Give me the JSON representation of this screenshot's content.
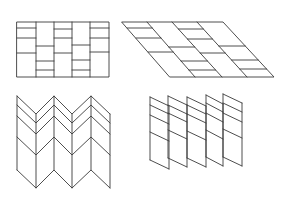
{
  "canvas": {
    "width": 285,
    "height": 198,
    "background": "#ffffff",
    "stroke_color": "#3a3a3a",
    "stroke_width": 0.9
  },
  "figures": [
    {
      "id": "brick-rectangle",
      "description": "Flat rectangle divided into 5 vertical strips with staggered horizontal crease lines",
      "outline": [
        [
          17,
          22
        ],
        [
          109,
          22
        ],
        [
          109,
          77
        ],
        [
          17,
          77
        ]
      ],
      "verticals": [
        36,
        54,
        72,
        90
      ],
      "strips": [
        {
          "x1": 17,
          "x2": 36,
          "ys": [
            28,
            38,
            53
          ]
        },
        {
          "x1": 36,
          "x2": 54,
          "ys": [
            46,
            61,
            70
          ]
        },
        {
          "x1": 54,
          "x2": 72,
          "ys": [
            29,
            38,
            53
          ]
        },
        {
          "x1": 72,
          "x2": 90,
          "ys": [
            45,
            60,
            70
          ]
        },
        {
          "x1": 90,
          "x2": 109,
          "ys": [
            28,
            38,
            52
          ]
        }
      ]
    },
    {
      "id": "sheared-parallelogram",
      "description": "Same pattern sheared into a parallelogram with 4 slanted strips",
      "top_y": 22,
      "bottom_y": 77,
      "slant_tops": [
        122,
        147,
        172,
        197,
        223
      ],
      "slant_bottoms": [
        170,
        195,
        222,
        247,
        274
      ],
      "strips": [
        {
          "ys": [
            28,
            38,
            52
          ]
        },
        {
          "ys": [
            47,
            61,
            70
          ]
        },
        {
          "ys": [
            29,
            39,
            53
          ]
        },
        {
          "ys": [
            46,
            60,
            69
          ]
        }
      ]
    },
    {
      "id": "zigzag-fold",
      "description": "Folded zigzag (chevron) surface with vertical fold lines",
      "xs": [
        17,
        36,
        54,
        72,
        91,
        110
      ],
      "zigzags": [
        {
          "peak": 96,
          "trough": 114
        },
        {
          "peak": 105,
          "trough": 123
        },
        {
          "peak": 116,
          "trough": 134
        },
        {
          "peak": 137,
          "trough": 155
        },
        {
          "peak": 170,
          "trough": 188
        }
      ],
      "peaks_at_even_index": true
    },
    {
      "id": "slanted-panels",
      "description": "Five separated slanted parallelogram panels with crease lines",
      "drop": 9,
      "panels": [
        {
          "x1": 150,
          "x2": 169,
          "ys": [
            97,
            105,
            115,
            132,
            160
          ]
        },
        {
          "x1": 168,
          "x2": 187,
          "ys": [
            96,
            105,
            113,
            130,
            158
          ]
        },
        {
          "x1": 187,
          "x2": 206,
          "ys": [
            97,
            105,
            114,
            131,
            158
          ]
        },
        {
          "x1": 206,
          "x2": 223,
          "ys": [
            95,
            103,
            113,
            130,
            157
          ]
        },
        {
          "x1": 223,
          "x2": 242,
          "ys": [
            94,
            103,
            113,
            129,
            157
          ]
        }
      ]
    }
  ]
}
